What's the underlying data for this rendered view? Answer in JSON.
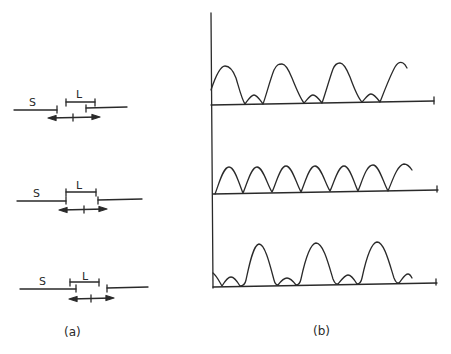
{
  "panel_a": {
    "caption": "(a)",
    "configs": [
      {
        "s_label": "S",
        "l_label": "L"
      },
      {
        "s_label": "S",
        "l_label": "L"
      },
      {
        "s_label": "S",
        "l_label": "L"
      }
    ]
  },
  "panel_b": {
    "caption": "(b)",
    "traces": [
      {
        "description": "large peaks alternating with small secondary bumps"
      },
      {
        "description": "uniform periodic peaks of equal height"
      },
      {
        "description": "small bumps then large peaks, phase shifted"
      }
    ]
  },
  "colors": {
    "ink": "#2a2a2a",
    "background": "#ffffff"
  }
}
